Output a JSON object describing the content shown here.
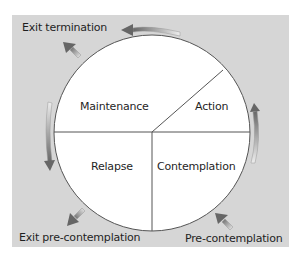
{
  "diagram": {
    "title": "",
    "colors": {
      "panel": "#d6d6d6",
      "circle_fill": "#ffffff",
      "circle_stroke": "#555555",
      "arrow_dark": "#6e6e6e",
      "arrow_light": "#ececec",
      "text": "#1f1f1f"
    },
    "segments": [
      {
        "id": "maintenance",
        "label": "Maintenance"
      },
      {
        "id": "action",
        "label": "Action"
      },
      {
        "id": "contemplation",
        "label": "Contemplation"
      },
      {
        "id": "relapse",
        "label": "Relapse"
      }
    ],
    "outer_labels": {
      "exit_termination": "Exit termination",
      "exit_precontemplation": "Exit pre-contemplation",
      "precontemplation": "Pre-contemplation"
    },
    "arrows": [
      {
        "id": "precontemplation-to-contemplation",
        "direction": "up-left"
      },
      {
        "id": "contemplation-to-action",
        "direction": "up"
      },
      {
        "id": "action-to-maintenance",
        "direction": "left"
      },
      {
        "id": "maintenance-to-exit-termination",
        "direction": "up-left"
      },
      {
        "id": "maintenance-to-relapse",
        "direction": "down"
      },
      {
        "id": "relapse-to-exit-precontemplation",
        "direction": "down-left"
      }
    ]
  }
}
